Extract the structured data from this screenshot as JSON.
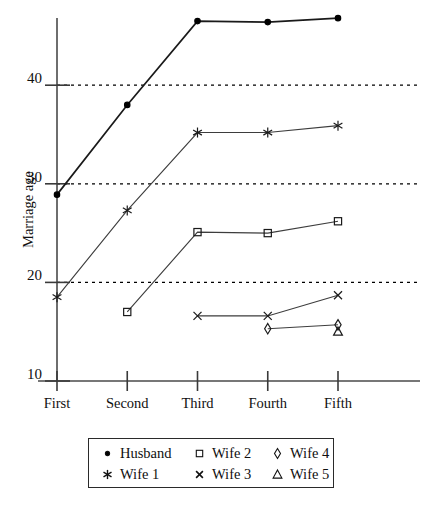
{
  "chart_data": {
    "type": "line",
    "title": "",
    "xlabel": "",
    "ylabel": "Marriage age",
    "categories": [
      "First",
      "Second",
      "Third",
      "Fourth",
      "Fifth"
    ],
    "yticks": [
      10,
      20,
      30,
      40
    ],
    "ylim": [
      10,
      47.5
    ],
    "grid": "horizontal dotted at 20, 30, 40",
    "legend_position": "below-plot",
    "series": [
      {
        "name": "Husband",
        "marker": "filled-circle",
        "values": [
          28.9,
          38.0,
          46.5,
          46.4,
          46.8
        ]
      },
      {
        "name": "Wife 1",
        "marker": "asterisk",
        "values": [
          18.5,
          27.3,
          35.2,
          35.2,
          35.9
        ]
      },
      {
        "name": "Wife 2",
        "marker": "open-square",
        "values": [
          null,
          17.0,
          25.1,
          25.0,
          26.2
        ]
      },
      {
        "name": "Wife 3",
        "marker": "cross-x",
        "values": [
          null,
          null,
          16.6,
          16.6,
          18.7
        ]
      },
      {
        "name": "Wife 4",
        "marker": "open-diamond",
        "values": [
          null,
          null,
          null,
          15.3,
          15.7
        ]
      },
      {
        "name": "Wife 5",
        "marker": "open-triangle",
        "values": [
          null,
          null,
          null,
          null,
          15.0
        ]
      }
    ]
  },
  "axis": {
    "y_title": "Marriage age",
    "y_tick_labels": [
      "40",
      "30",
      "20",
      "10"
    ],
    "x_tick_labels": [
      "First",
      "Second",
      "Third",
      "Fourth",
      "Fifth"
    ]
  },
  "legend": {
    "entries": [
      {
        "label": "Husband",
        "marker": "filled-circle"
      },
      {
        "label": "Wife 2",
        "marker": "open-square"
      },
      {
        "label": "Wife 4",
        "marker": "open-diamond"
      },
      {
        "label": "Wife 1",
        "marker": "asterisk"
      },
      {
        "label": "Wife 3",
        "marker": "cross-x"
      },
      {
        "label": "Wife 5",
        "marker": "open-triangle"
      }
    ]
  }
}
